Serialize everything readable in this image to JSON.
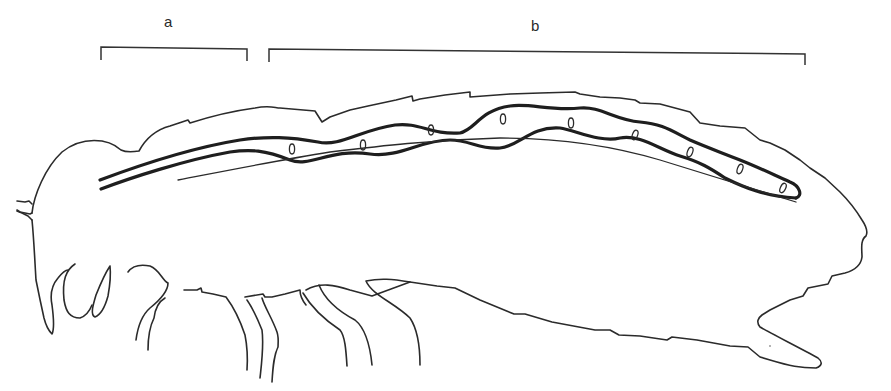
{
  "figure": {
    "labels": {
      "a": "a",
      "b": "b"
    },
    "brackets": [
      {
        "id": "a",
        "x_start": 101,
        "x_end": 247,
        "y": 47
      },
      {
        "id": "b",
        "x_start": 269,
        "x_end": 805,
        "y": 50
      }
    ],
    "egg_count": 10,
    "colors": {
      "line": "#2b2b2b",
      "background": "#ffffff"
    }
  }
}
